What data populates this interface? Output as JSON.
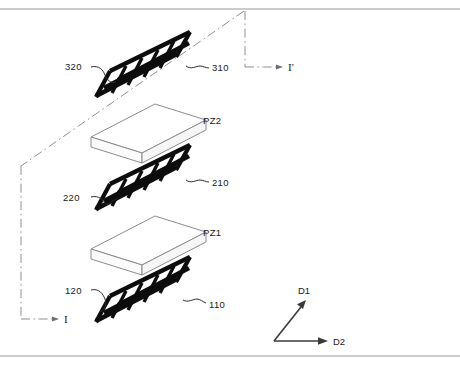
{
  "figure": {
    "type": "patent-exploded-view",
    "border": {
      "top_rule": true,
      "bottom_rule": true,
      "color": "#9a9a9a"
    },
    "colors": {
      "electrode": "#0d0d0d",
      "slab_outline": "#8c8c8c",
      "slab_fill": "#ffffff",
      "leader": "#2b2b2b",
      "section_line": "#8f8f8f",
      "axis": "#3a3a3a",
      "text": "#1a1a1a"
    },
    "electrodes": [
      {
        "id": "electrode-top",
        "tier": 3,
        "right_label": "310",
        "left_label": "320",
        "finger_count": 6
      },
      {
        "id": "electrode-middle",
        "tier": 2,
        "right_label": "210",
        "left_label": "220",
        "finger_count": 6
      },
      {
        "id": "electrode-bottom",
        "tier": 1,
        "right_label": "110",
        "left_label": "120",
        "finger_count": 6
      }
    ],
    "piezo_layers": [
      {
        "id": "piezo-upper",
        "label": "PZ2"
      },
      {
        "id": "piezo-lower",
        "label": "PZ1"
      }
    ],
    "section_line": {
      "start_marker": "I",
      "end_marker": "I'",
      "style": "dash-dot"
    },
    "direction_axes": {
      "vertical_label": "D1",
      "horizontal_label": "D2"
    }
  }
}
